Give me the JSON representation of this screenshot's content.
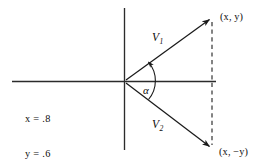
{
  "figure": {
    "type": "vector-diagram",
    "background_color": "#ffffff",
    "stroke_color": "#1a1a1a",
    "text_color": "#0d0d0d",
    "axes": {
      "horizontal": {
        "y": 81,
        "x_start": 12,
        "x_end": 216
      },
      "vertical": {
        "x": 124,
        "y_start": 8,
        "y_end": 150
      },
      "origin": {
        "x": 124,
        "y": 81
      }
    },
    "vectors": [
      {
        "name": "V1",
        "label": "V",
        "subscript": "1",
        "from": {
          "x": 124,
          "y": 81
        },
        "to": {
          "x": 213,
          "y": 16
        },
        "style": "solid",
        "arrowhead": true
      },
      {
        "name": "V2",
        "label": "V",
        "subscript": "2",
        "from": {
          "x": 124,
          "y": 81
        },
        "to": {
          "x": 213,
          "y": 150
        },
        "style": "solid",
        "arrowhead": true
      }
    ],
    "connector": {
      "name": "dashed-vertical-connector",
      "x": 212,
      "y_start": 18,
      "y_end": 149,
      "style": "dashed"
    },
    "angle_arc": {
      "label": "α",
      "center": {
        "x": 124,
        "y": 81
      },
      "radius": 26,
      "from_vector": "V2",
      "to_vector": "V1",
      "arrowhead": true
    },
    "labels": {
      "v1": "V",
      "v1_sub": "1",
      "v2": "V",
      "v2_sub": "2",
      "alpha": "α",
      "point_upper": "(x, y)",
      "point_lower": "(x, −y)",
      "value_x": "x = .8",
      "value_y": "y = .6"
    }
  }
}
